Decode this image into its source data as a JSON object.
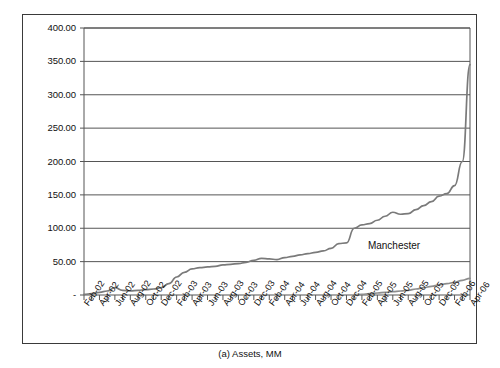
{
  "caption": "(a)  Assets, MM",
  "annotation": {
    "label": "Manchester"
  },
  "chart_data": {
    "type": "line",
    "title": "",
    "subtitle": "",
    "xlabel": "",
    "ylabel": "",
    "caption": "(a)  Assets, MM",
    "grid": true,
    "legend_position": "none",
    "annotations": [
      {
        "text": "Manchester",
        "x": "Feb-05",
        "y": 72
      }
    ],
    "ylim": [
      0,
      400
    ],
    "ytick_labels": [
      "400.00",
      "350.00",
      "300.00",
      "250.00",
      "200.00",
      "150.00",
      "100.00",
      "50.00",
      "-"
    ],
    "ytick_values": [
      400,
      350,
      300,
      250,
      200,
      150,
      100,
      50,
      0
    ],
    "xtick_labels": [
      "Feb-02",
      "Apr-02",
      "Jun-02",
      "Aug-02",
      "Oct-02",
      "Dec-02",
      "Feb-03",
      "Apr-03",
      "Jun-03",
      "Aug-03",
      "Oct-03",
      "Dec-03",
      "Feb-04",
      "Apr-04",
      "Jun-04",
      "Aug-04",
      "Oct-04",
      "Dec-04",
      "Feb-05",
      "Apr-05",
      "Jun-05",
      "Aug-05",
      "Oct-05",
      "Dec-05",
      "Feb-06",
      "Apr-06"
    ],
    "x": [
      "Feb-02",
      "Mar-02",
      "Apr-02",
      "May-02",
      "Jun-02",
      "Jul-02",
      "Aug-02",
      "Sep-02",
      "Oct-02",
      "Nov-02",
      "Dec-02",
      "Jan-03",
      "Feb-03",
      "Mar-03",
      "Apr-03",
      "May-03",
      "Jun-03",
      "Jul-03",
      "Aug-03",
      "Sep-03",
      "Oct-03",
      "Nov-03",
      "Dec-03",
      "Jan-04",
      "Feb-04",
      "Mar-04",
      "Apr-04",
      "May-04",
      "Jun-04",
      "Jul-04",
      "Aug-04",
      "Sep-04",
      "Oct-04",
      "Nov-04",
      "Dec-04",
      "Jan-05",
      "Feb-05",
      "Mar-05",
      "Apr-05",
      "May-05",
      "Jun-05",
      "Jul-05",
      "Aug-05",
      "Sep-05",
      "Oct-05",
      "Nov-05",
      "Dec-05",
      "Jan-06",
      "Feb-06",
      "Mar-06",
      "Apr-06"
    ],
    "series": [
      {
        "name": "Manchester",
        "color": "#7a7a7a",
        "values": [
          1,
          2,
          4,
          6,
          11,
          7,
          6,
          7,
          8,
          9,
          11,
          17,
          27,
          34,
          39,
          41,
          42,
          43,
          45,
          46,
          47,
          49,
          52,
          55,
          54,
          53,
          56,
          58,
          60,
          62,
          64,
          66,
          70,
          77,
          78,
          100,
          105,
          107,
          112,
          118,
          124,
          121,
          122,
          128,
          134,
          140,
          148,
          152,
          164,
          200,
          345
        ]
      },
      {
        "name": "second-series",
        "color": "#8d8d8d",
        "values": [
          null,
          null,
          null,
          null,
          null,
          null,
          null,
          null,
          null,
          null,
          null,
          null,
          null,
          null,
          null,
          null,
          null,
          null,
          null,
          null,
          null,
          null,
          null,
          null,
          null,
          null,
          null,
          null,
          null,
          null,
          null,
          null,
          null,
          null,
          null,
          0.5,
          1,
          2,
          3,
          4,
          5,
          6,
          7,
          9,
          11,
          13,
          15,
          17,
          19,
          22,
          25
        ]
      }
    ]
  }
}
